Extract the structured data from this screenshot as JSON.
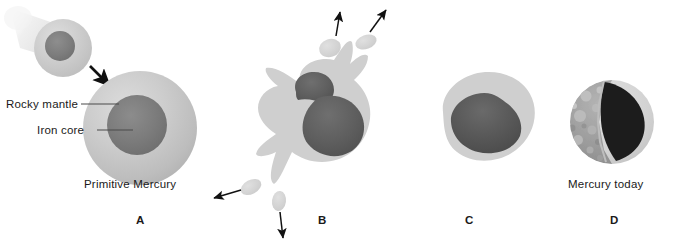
{
  "figure": {
    "background_color": "#ffffff"
  },
  "palette": {
    "mantle_light": "#c9c9c9",
    "mantle_mid": "#b8b8b8",
    "mantle_edge": "#d5d5d5",
    "core_dark": "#7a7a7a",
    "core_darker": "#6b6b6b",
    "core_blob": "#575757",
    "core_black": "#1c1c1c",
    "trail": "#e3e3e3",
    "arrow": "#111111",
    "text": "#1a1a1a",
    "surface_gray": "#9a9a9a"
  },
  "labels": {
    "rocky_mantle": "Rocky mantle",
    "iron_core": "Iron core"
  },
  "panels": [
    {
      "letter": "A",
      "caption": "Primitive Mercury",
      "description": "Large differentiated proto-planet with rocky mantle and iron core, struck by an incoming impactor"
    },
    {
      "letter": "B",
      "caption": "",
      "description": "Impact shatters the body; mantle material splatters outward and ejecta blobs fly away"
    },
    {
      "letter": "C",
      "caption": "",
      "description": "Remaining body retains most of the iron core with a thin rocky mantle"
    },
    {
      "letter": "D",
      "caption": "Mercury today",
      "description": "Present-day Mercury, cutaway showing cratered crust and oversized iron core"
    }
  ],
  "ejecta": [
    {
      "name": "ejecta-upper-left",
      "direction": "up"
    },
    {
      "name": "ejecta-upper-right",
      "direction": "up-right"
    },
    {
      "name": "ejecta-lower-left",
      "direction": "down-left"
    },
    {
      "name": "ejecta-lower-center",
      "direction": "down"
    }
  ],
  "arrows": [
    {
      "name": "impactor-arrow",
      "direction": "down-right"
    },
    {
      "name": "ejecta-arrow-up",
      "direction": "up"
    },
    {
      "name": "ejecta-arrow-up-right",
      "direction": "up-right"
    },
    {
      "name": "ejecta-arrow-down-left",
      "direction": "down-left"
    },
    {
      "name": "ejecta-arrow-down",
      "direction": "down"
    }
  ]
}
